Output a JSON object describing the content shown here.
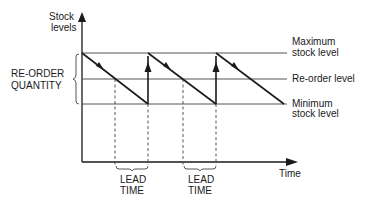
{
  "diagram": {
    "y_axis_label": [
      "Stock",
      "levels"
    ],
    "x_axis_label": "Time",
    "left_bracket_label": [
      "RE-ORDER",
      "QUANTITY"
    ],
    "levels": {
      "maximum": [
        "Maximum",
        "stock level"
      ],
      "reorder": "Re-order level",
      "minimum": [
        "Minimum",
        "stock level"
      ]
    },
    "lead_time_labels": [
      [
        "LEAD",
        "TIME"
      ],
      [
        "LEAD",
        "TIME"
      ]
    ],
    "colors": {
      "line": "#1a1a1a",
      "level_line": "#555555",
      "dashed": "#444444"
    }
  }
}
